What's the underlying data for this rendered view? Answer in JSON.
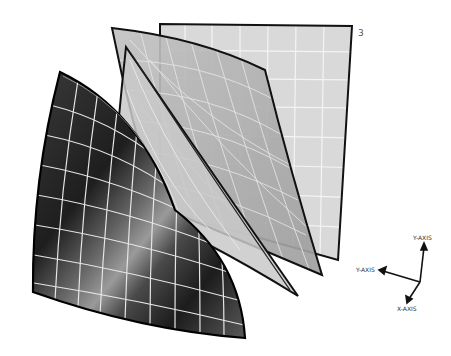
{
  "diagram": {
    "title": "",
    "layers": [
      {
        "id": "back",
        "label": "3",
        "fill": "#d8d8d8",
        "grid": "#f2f2f2",
        "stroke": "#111111"
      },
      {
        "id": "middle-curved",
        "label": "",
        "fill": "#b5b5b5",
        "grid": "#e6e6e6",
        "stroke": "#111111"
      },
      {
        "id": "thin-curved",
        "label": "",
        "fill": "#c8c8c8",
        "grid": "#ebebeb",
        "stroke": "#111111"
      },
      {
        "id": "front-dark",
        "label": "",
        "fill": "#2a2a2a",
        "grid": "#e8e8e8",
        "stroke": "#000000"
      }
    ],
    "axes": {
      "up_label": "Y-AXIS",
      "left_label": "Y-AXIS",
      "down_label": "X-AXIS"
    }
  }
}
